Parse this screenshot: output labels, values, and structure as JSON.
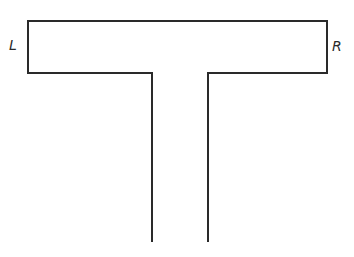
{
  "diagram": {
    "shape": "T-shaped outline",
    "labels": {
      "left": "L",
      "right": "R"
    },
    "stroke_color": "#2a2a2a",
    "outline_points": [
      [
        152,
        242
      ],
      [
        152,
        73
      ],
      [
        28,
        73
      ],
      [
        28,
        21
      ],
      [
        327,
        21
      ],
      [
        327,
        73
      ],
      [
        208,
        73
      ],
      [
        208,
        242
      ]
    ]
  }
}
